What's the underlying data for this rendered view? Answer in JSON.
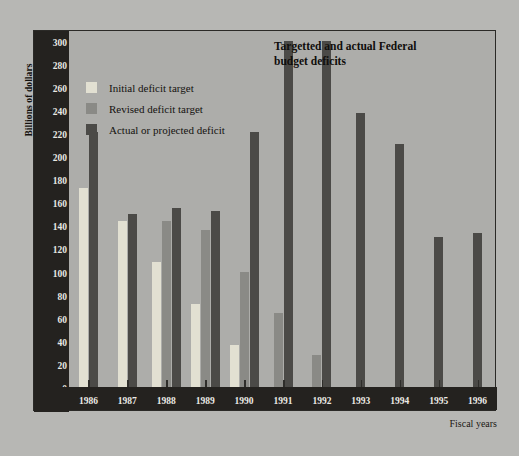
{
  "axis": {
    "y_title": "Billions of dollars",
    "x_title": "Fiscal years",
    "y_ticks": [
      0,
      20,
      40,
      60,
      80,
      100,
      120,
      140,
      160,
      180,
      200,
      220,
      240,
      260,
      280,
      300
    ]
  },
  "title": {
    "line1": "Targetted and actual Federal",
    "line2": "budget deficits"
  },
  "legend": [
    {
      "label": "Initial deficit target",
      "color": "#e2e0d2"
    },
    {
      "label": "Revised deficit target",
      "color": "#8a8a86"
    },
    {
      "label": "Actual or projected deficit",
      "color": "#4b4a47"
    }
  ],
  "chart_data": {
    "type": "bar",
    "title": "Targetted and actual Federal budget deficits",
    "xlabel": "Fiscal years",
    "ylabel": "Billions of dollars",
    "ylim": [
      0,
      310
    ],
    "ytick_step": 20,
    "grid": false,
    "legend_position": "upper-left",
    "categories": [
      "1986",
      "1987",
      "1988",
      "1989",
      "1990",
      "1991",
      "1992",
      "1993",
      "1994",
      "1995",
      "1996"
    ],
    "series": [
      {
        "name": "Initial deficit target",
        "color": "#e2e0d2",
        "values": [
          172,
          144,
          108,
          72,
          36,
          null,
          null,
          null,
          null,
          null,
          null
        ]
      },
      {
        "name": "Revised deficit target",
        "color": "#8a8a86",
        "values": [
          null,
          null,
          144,
          136,
          100,
          64,
          28,
          null,
          null,
          null,
          null
        ]
      },
      {
        "name": "Actual or projected deficit",
        "color": "#4b4a47",
        "values": [
          221,
          150,
          155,
          152,
          221,
          300,
          300,
          237,
          210,
          130,
          133
        ]
      }
    ]
  }
}
